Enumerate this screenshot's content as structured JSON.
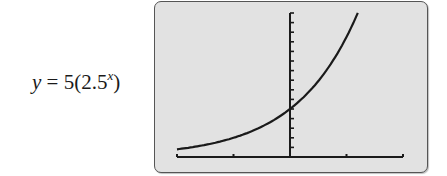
{
  "equation": {
    "lhs": "y",
    "equals": " = 5(2.5",
    "exponent": "x",
    "close": ")"
  },
  "chart_data": {
    "type": "line",
    "title": "",
    "function": "y = 5(2.5^x)",
    "xlabel": "",
    "ylabel": "",
    "xlim": [
      -2,
      2
    ],
    "ylim": [
      0,
      15
    ],
    "x_tick_step": 1,
    "y_tick_step": 1,
    "grid": false,
    "legend": "none",
    "series": [
      {
        "name": "y = 5(2.5^x)",
        "x": [
          -2,
          -1.5,
          -1,
          -0.5,
          0,
          0.25,
          0.5,
          0.75,
          1,
          1.1,
          1.2
        ],
        "y": [
          0.8,
          1.26,
          2.0,
          3.16,
          5.0,
          6.29,
          7.91,
          9.94,
          12.5,
          13.8,
          15.0
        ]
      }
    ]
  },
  "colors": {
    "screen_bg": "#e2e2e2",
    "frame": "#555555",
    "ink": "#1a1a1a"
  }
}
